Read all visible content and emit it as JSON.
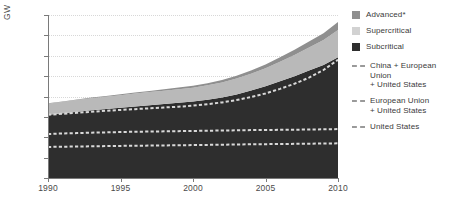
{
  "chart_data": {
    "type": "area",
    "title": "",
    "subtitle": "",
    "xlabel": "",
    "ylabel": "GW",
    "xlim": [
      1990,
      2010
    ],
    "ylim": [
      0,
      1600
    ],
    "ytick_labels": [
      "0",
      "200",
      "400",
      "600",
      "800",
      "1 000",
      "1 200",
      "1 400",
      "1 600"
    ],
    "ytick_values": [
      0,
      200,
      400,
      600,
      800,
      1000,
      1200,
      1400,
      1600
    ],
    "xtick_labels": [
      "1990",
      "1995",
      "2000",
      "2005",
      "2010"
    ],
    "xtick_values": [
      1990,
      1995,
      2000,
      2005,
      2010
    ],
    "grid": "horizontal-dotted",
    "legend_position": "right",
    "stacked": true,
    "x": [
      1990,
      1991,
      1992,
      1993,
      1994,
      1995,
      1996,
      1997,
      1998,
      1999,
      2000,
      2001,
      2002,
      2003,
      2004,
      2005,
      2006,
      2007,
      2008,
      2009,
      2010
    ],
    "series": [
      {
        "name": "Subcritical",
        "color": "#2e2e2e",
        "values": [
          620,
          635,
          650,
          665,
          678,
          690,
          703,
          715,
          726,
          738,
          750,
          768,
          790,
          820,
          858,
          900,
          950,
          1000,
          1055,
          1110,
          1185
        ]
      },
      {
        "name": "Supercritical",
        "color": "#b9b9b9",
        "values": [
          110,
          112,
          115,
          118,
          120,
          123,
          126,
          128,
          131,
          134,
          137,
          142,
          148,
          156,
          166,
          178,
          192,
          208,
          226,
          245,
          268
        ]
      },
      {
        "name": "Advanced*",
        "color": "#8f8f8f",
        "values": [
          4,
          5,
          6,
          7,
          8,
          9,
          11,
          12,
          14,
          16,
          18,
          21,
          24,
          28,
          32,
          37,
          43,
          50,
          58,
          67,
          78
        ]
      }
    ],
    "reference_lines": [
      {
        "name": "China + European Union + United States",
        "color": "#d9d9d9",
        "style": "dashed",
        "values": [
          620,
          630,
          640,
          650,
          660,
          668,
          676,
          684,
          692,
          700,
          710,
          725,
          742,
          765,
          795,
          830,
          875,
          925,
          985,
          1060,
          1160
        ]
      },
      {
        "name": "European Union + United States",
        "color": "#d9d9d9",
        "style": "dashed",
        "values": [
          432,
          437,
          441,
          445,
          448,
          451,
          454,
          456,
          458,
          460,
          462,
          464,
          466,
          468,
          470,
          471,
          473,
          474,
          476,
          478,
          480
        ]
      },
      {
        "name": "United States",
        "color": "#d9d9d9",
        "style": "dashed",
        "values": [
          305,
          307,
          309,
          311,
          313,
          315,
          317,
          318,
          320,
          321,
          323,
          325,
          327,
          329,
          331,
          332,
          334,
          335,
          337,
          338,
          340
        ]
      }
    ]
  },
  "legend": {
    "items": [
      {
        "label": "Advanced*",
        "swatch": "#8f8f8f",
        "type": "swatch"
      },
      {
        "label": "Supercritical",
        "swatch": "#d2d2d2",
        "type": "swatch"
      },
      {
        "label": "Subcritical",
        "swatch": "#2e2e2e",
        "type": "swatch"
      },
      {
        "label": "China + European Union",
        "label2": "+ United States",
        "type": "dash"
      },
      {
        "label": "European Union",
        "label2": "+ United States",
        "type": "dash"
      },
      {
        "label": "United States",
        "label2": "",
        "type": "dash"
      }
    ]
  }
}
